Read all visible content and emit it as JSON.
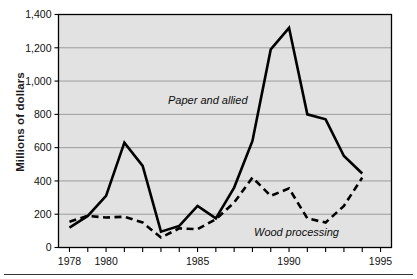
{
  "chart_data": {
    "type": "line",
    "title": "",
    "xlabel": "",
    "ylabel": "Millions of dollars",
    "xlim": [
      1977.4,
      1995.6
    ],
    "ylim": [
      0,
      1400
    ],
    "grid": "horizontal",
    "legend_position": "inline-annotations",
    "x": [
      1978,
      1979,
      1980,
      1981,
      1982,
      1983,
      1984,
      1985,
      1986,
      1987,
      1988,
      1989,
      1990,
      1991,
      1992,
      1993,
      1994
    ],
    "ytick_labels": [
      "0",
      "200",
      "400",
      "600",
      "800",
      "1,000",
      "1,200",
      "1,400"
    ],
    "ytick_values": [
      0,
      200,
      400,
      600,
      800,
      1000,
      1200,
      1400
    ],
    "xtick_values": [
      1978,
      1979,
      1980,
      1981,
      1982,
      1983,
      1984,
      1985,
      1986,
      1987,
      1988,
      1989,
      1990,
      1991,
      1992,
      1993,
      1994,
      1995
    ],
    "xtick_labeled": [
      {
        "value": 1978,
        "label": "1978"
      },
      {
        "value": 1980,
        "label": "1980"
      },
      {
        "value": 1985,
        "label": "1985"
      },
      {
        "value": 1990,
        "label": "1990"
      },
      {
        "value": 1995,
        "label": "1995"
      }
    ],
    "series": [
      {
        "name": "Paper and allied",
        "style": "solid",
        "color": "#000000",
        "annotation": "Paper and allied",
        "values": [
          120,
          190,
          310,
          630,
          490,
          95,
          130,
          250,
          175,
          360,
          640,
          1190,
          1320,
          800,
          770,
          550,
          445
        ]
      },
      {
        "name": "Wood processing",
        "style": "dashed",
        "color": "#000000",
        "annotation": "Wood processing",
        "values": [
          155,
          190,
          180,
          185,
          150,
          60,
          115,
          110,
          170,
          270,
          420,
          310,
          355,
          175,
          150,
          250,
          420
        ]
      }
    ]
  },
  "colors": {
    "plot_background": "#e2e2e2",
    "gridline": "#8a8a8a",
    "axis": "#000000",
    "line": "#000000",
    "page_background": "#ffffff"
  }
}
